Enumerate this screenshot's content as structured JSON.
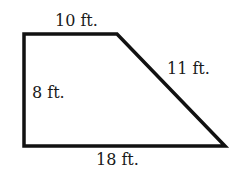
{
  "figure": {
    "shape": "right trapezoid",
    "stroke_color": "#111111",
    "fill_color": "#ffffff",
    "vertices": [
      [
        24,
        34
      ],
      [
        117,
        34
      ],
      [
        225,
        146
      ],
      [
        24,
        146
      ]
    ],
    "labels": {
      "top": "10 ft.",
      "slant": "11 ft.",
      "left": "8 ft.",
      "bottom": "18 ft."
    }
  }
}
